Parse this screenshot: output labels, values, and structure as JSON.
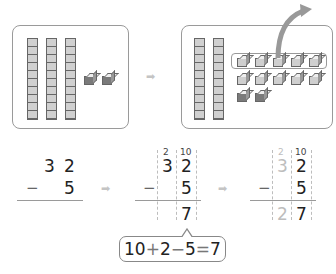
{
  "top_left_panel": {
    "tens_rods": 3,
    "unit_cubes": 2,
    "represents": "32"
  },
  "top_right_panel": {
    "tens_rods": 2,
    "unit_cubes_light": 10,
    "unit_cubes_dark": 2,
    "highlighted_group": "5 of 10 ones taken away",
    "note": "one ten regrouped into 10 ones"
  },
  "arrows": {
    "symbol": "➡"
  },
  "step1": {
    "tens": "3",
    "ones": "2",
    "minus": "−",
    "subtrahend": "5"
  },
  "step2": {
    "borrow_tens": "2",
    "borrow_ones": "10",
    "tens": "3",
    "ones": "2",
    "minus": "−",
    "subtrahend": "5",
    "result_ones": "7"
  },
  "step3": {
    "borrow_tens": "2",
    "borrow_ones": "10",
    "tens": "3",
    "ones": "2",
    "minus": "−",
    "subtrahend": "5",
    "result_tens": "2",
    "result_ones": "7"
  },
  "bubble": {
    "expression": "10+2−5=7",
    "parts": [
      "10",
      "+",
      "2",
      "−",
      "5",
      "−",
      "7"
    ]
  }
}
